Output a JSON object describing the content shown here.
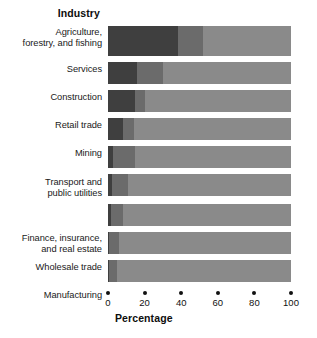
{
  "chart_data": {
    "type": "bar",
    "orientation": "horizontal",
    "stacked": true,
    "title": "",
    "xlabel": "Percentage",
    "ylabel": "Industry",
    "xlim": [
      0,
      100
    ],
    "xticks": [
      0,
      20,
      40,
      60,
      80,
      100
    ],
    "xtick_labels": [
      "0",
      "20",
      "40",
      "60",
      "80",
      "100"
    ],
    "grid": false,
    "legend": "none",
    "categories": [
      "Agriculture, forestry, and fishing",
      "Services",
      "Construction",
      "Retail trade",
      "Mining",
      "Transport and public utilities",
      "Finance, insurance, and real estate",
      "Wholesale trade",
      "Manufacturing"
    ],
    "series": [
      {
        "name": "dark",
        "color": "#3f3f3f",
        "values": [
          38,
          16,
          15,
          8,
          3,
          2,
          1.5,
          0.8,
          0.4
        ]
      },
      {
        "name": "medium",
        "color": "#6b6b6b",
        "values": [
          14,
          14,
          5,
          6,
          12,
          9,
          6.5,
          5.2,
          4.6
        ]
      },
      {
        "name": "light",
        "color": "#8a8a8a",
        "values": [
          48,
          70,
          80,
          86,
          85,
          89,
          92,
          94,
          95
        ]
      }
    ]
  },
  "labels": {
    "y_axis_title": "Industry",
    "x_axis_title": "Percentage",
    "categories": [
      {
        "line1": "Agriculture,",
        "line2": "forestry, and fishing"
      },
      {
        "line1": "Services",
        "line2": ""
      },
      {
        "line1": "Construction",
        "line2": ""
      },
      {
        "line1": "Retail trade",
        "line2": ""
      },
      {
        "line1": "Mining",
        "line2": ""
      },
      {
        "line1": "Transport and",
        "line2": "public utilities"
      },
      {
        "line1": "Finance, insurance,",
        "line2": "and real estate"
      },
      {
        "line1": "Wholesale trade",
        "line2": ""
      },
      {
        "line1": "Manufacturing",
        "line2": ""
      }
    ]
  },
  "colors": {
    "background": "#ffffff",
    "text": "#111111",
    "segment_dark": "#3f3f3f",
    "segment_medium": "#6b6b6b",
    "segment_light": "#8a8a8a"
  }
}
